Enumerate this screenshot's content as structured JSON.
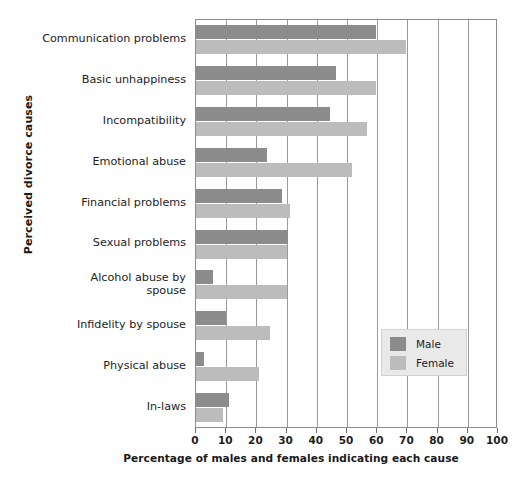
{
  "chart_data": {
    "type": "bar",
    "orientation": "horizontal",
    "title": "",
    "xlabel": "Percentage of males and females indicating each cause",
    "ylabel": "Perceived divorce causes",
    "xlim": [
      0,
      100
    ],
    "xticks": [
      0,
      10,
      20,
      30,
      40,
      50,
      60,
      70,
      80,
      90,
      100
    ],
    "grid": true,
    "grid_axis": "x",
    "legend_position": "center-right",
    "categories": [
      "Communication problems",
      "Basic unhappiness",
      "Incompatibility",
      "Emotional abuse",
      "Financial problems",
      "Sexual problems",
      "Alcohol abuse by spouse",
      "Infidelity by spouse",
      "Physical abuse",
      "In-laws"
    ],
    "series": [
      {
        "name": "Male",
        "color": "#8c8c8c",
        "values": [
          59.5,
          46.5,
          44.5,
          23.5,
          28.5,
          30.5,
          5.5,
          10.0,
          2.5,
          11.0
        ]
      },
      {
        "name": "Female",
        "color": "#bcbcbc",
        "values": [
          69.5,
          59.5,
          56.5,
          51.5,
          31.0,
          30.0,
          30.0,
          24.5,
          21.0,
          9.0
        ]
      }
    ]
  },
  "legend": {
    "items": [
      {
        "label": "Male",
        "swatch": "male"
      },
      {
        "label": "Female",
        "swatch": "female"
      }
    ]
  }
}
